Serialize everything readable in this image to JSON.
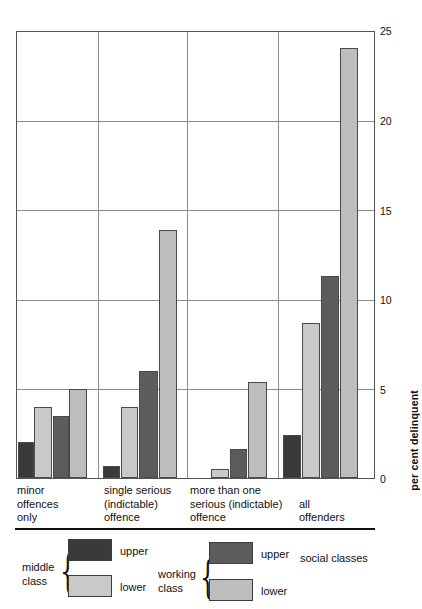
{
  "chart_data": {
    "type": "bar",
    "title": "",
    "xlabel": "",
    "ylabel": "per cent delinquent",
    "ylim": [
      0,
      25
    ],
    "yticks": [
      0,
      5,
      10,
      15,
      20,
      25
    ],
    "grid": true,
    "legend_position": "below-axes",
    "categories": [
      "minor offences only",
      "single serious (indictable) offence",
      "more than one serious (indictable) offence",
      "all offenders"
    ],
    "category_label_lines": [
      [
        "minor",
        "offences",
        "only"
      ],
      [
        "single serious",
        "(indictable)",
        "offence"
      ],
      [
        "more than one",
        "serious (indictable)",
        "offence"
      ],
      [
        "all",
        "offenders"
      ]
    ],
    "series": [
      {
        "name": "middle class upper",
        "color": "#3a3a3a",
        "values": [
          2.0,
          0.7,
          0.0,
          2.4
        ]
      },
      {
        "name": "middle class lower",
        "color": "#c9c9c9",
        "values": [
          4.0,
          4.0,
          0.5,
          8.7
        ]
      },
      {
        "name": "working class upper",
        "color": "#5c5c5c",
        "values": [
          3.5,
          6.0,
          1.6,
          11.3
        ]
      },
      {
        "name": "working class lower",
        "color": "#bdbdbd",
        "values": [
          5.0,
          13.9,
          5.4,
          24.1
        ]
      }
    ]
  },
  "axis": {
    "tick_labels": [
      "25",
      "20",
      "15",
      "10",
      "5",
      "0"
    ],
    "y_axis_title": "per cent delinquent"
  },
  "legend": {
    "groups": [
      {
        "group_label_lines": [
          "middle",
          "class"
        ],
        "entries": [
          {
            "label": "upper",
            "color": "#3a3a3a"
          },
          {
            "label": "lower",
            "color": "#c9c9c9"
          }
        ]
      },
      {
        "group_label_lines": [
          "working",
          "class"
        ],
        "entries": [
          {
            "label": "upper",
            "color": "#5c5c5c"
          },
          {
            "label": "lower",
            "color": "#bdbdbd"
          }
        ]
      }
    ],
    "caption": "social classes",
    "brace_glyph": "{"
  }
}
